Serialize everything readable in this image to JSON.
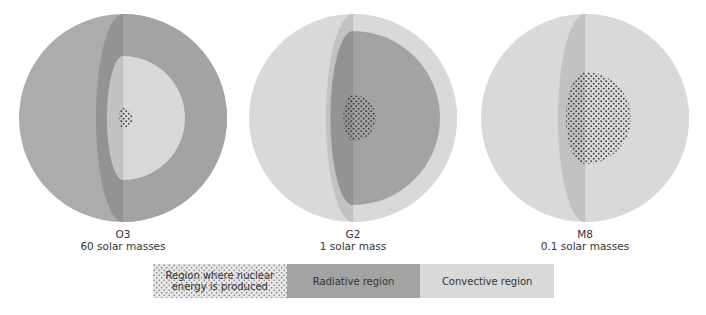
{
  "colors": {
    "background": "#ffffff",
    "radiative": "#a3a3a3",
    "radiative_dark": "#939393",
    "convective": "#d9d9d9",
    "convective_mid": "#c2c2c2",
    "surface_hot": "#acacac",
    "core_dots": "#3c3c3c"
  },
  "stars": [
    {
      "id": "O3",
      "class_label": "O3",
      "mass_label": "60 solar masses",
      "cx": 123,
      "cy": 118,
      "r": 104,
      "surface": "radiative",
      "layers": [
        {
          "region": "radiative",
          "outer_r": 104,
          "inner_r": 62
        },
        {
          "region": "convective",
          "outer_r": 62,
          "inner_r": 10
        }
      ],
      "core_r": 10,
      "label_x": 123,
      "label_y": 229
    },
    {
      "id": "G2",
      "class_label": "G2",
      "mass_label": "1 solar mass",
      "cx": 353,
      "cy": 118,
      "r": 104,
      "surface": "convective",
      "layers": [
        {
          "region": "convective",
          "outer_r": 104,
          "inner_r": 87
        },
        {
          "region": "radiative",
          "outer_r": 87,
          "inner_r": 23
        }
      ],
      "core_r": 23,
      "label_x": 353,
      "label_y": 229
    },
    {
      "id": "M8",
      "class_label": "M8",
      "mass_label": "0.1 solar masses",
      "cx": 585,
      "cy": 118,
      "r": 104,
      "surface": "convective",
      "layers": [
        {
          "region": "convective",
          "outer_r": 104,
          "inner_r": 46
        }
      ],
      "core_r": 46,
      "label_x": 585,
      "label_y": 229
    }
  ],
  "legend": {
    "items": [
      {
        "key": "core",
        "label_line1": "Region where nuclear",
        "label_line2": "energy is produced",
        "fill": "dotted"
      },
      {
        "key": "radiative",
        "label": "Radiative region",
        "fill": "#a3a3a3"
      },
      {
        "key": "convective",
        "label": "Convective region",
        "fill": "#d9d9d9"
      }
    ]
  }
}
